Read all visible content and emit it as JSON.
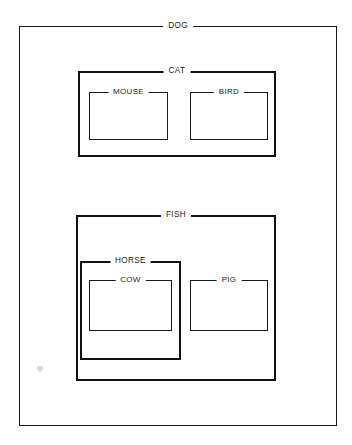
{
  "diagram": {
    "type": "nested-containment",
    "title": "DOG",
    "background_color": "#ffffff",
    "line_color": "#171717",
    "text_color": "#1b1b1b",
    "boxes": {
      "dog": {
        "label": "DOG",
        "level": 0,
        "x": 19,
        "y": 26,
        "w": 318,
        "h": 400,
        "parent": null
      },
      "cat": {
        "label": "CAT",
        "level": 1,
        "x": 78,
        "y": 71,
        "w": 198,
        "h": 86,
        "parent": "dog"
      },
      "mouse": {
        "label": "MOUSE",
        "level": 2,
        "x": 89,
        "y": 92,
        "w": 79,
        "h": 48,
        "parent": "cat"
      },
      "bird": {
        "label": "BIRD",
        "level": 2,
        "x": 190,
        "y": 92,
        "w": 78,
        "h": 48,
        "parent": "cat"
      },
      "fish": {
        "label": "FISH",
        "level": 1,
        "x": 76,
        "y": 215,
        "w": 200,
        "h": 166,
        "parent": "dog"
      },
      "horse": {
        "label": "HORSE",
        "level": 2,
        "x": 80,
        "y": 261,
        "w": 101,
        "h": 99,
        "parent": "fish"
      },
      "cow": {
        "label": "COW",
        "level": 3,
        "x": 89,
        "y": 280,
        "w": 83,
        "h": 51,
        "parent": "horse"
      },
      "pig": {
        "label": "PIG",
        "level": 2,
        "x": 190,
        "y": 280,
        "w": 78,
        "h": 51,
        "parent": "fish"
      }
    },
    "artifact": {
      "name": "scan-speck",
      "x": 37,
      "y": 366
    }
  }
}
